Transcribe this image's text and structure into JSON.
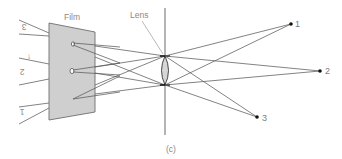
{
  "figure": {
    "caption": "(c)",
    "film_label": "Film",
    "lens_label": "Lens",
    "colors": {
      "film_fill": "#cfcfcf",
      "film_stroke": "#6e6e6e",
      "ray": "#5a5a5a",
      "lens_fill": "#d6d6d6",
      "axis": "#6a6a6a",
      "point": "#111111",
      "label": "#8a8a8a"
    },
    "object_points": [
      {
        "label": "1",
        "x": 291,
        "y": 24
      },
      {
        "label": "2",
        "x": 320,
        "y": 71
      },
      {
        "label": "3",
        "x": 257,
        "y": 117
      }
    ],
    "image_labels_inverted": [
      {
        "label": "3",
        "x": 12,
        "y": 30
      },
      {
        "label": "2",
        "x": 12,
        "y": 72
      },
      {
        "label": "1",
        "x": 12,
        "y": 111
      }
    ],
    "lens": {
      "cx": 165,
      "top_y": 56,
      "bottom_y": 85
    },
    "axis": {
      "x": 165,
      "y1": 8,
      "y2": 135
    }
  }
}
